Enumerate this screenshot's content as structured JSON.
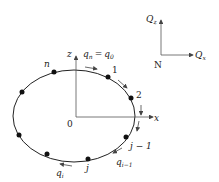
{
  "diagram": {
    "type": "elliptical closed contour with discrete nodes",
    "axes": {
      "origin_label": "0",
      "x_label": "x",
      "z_label": "z"
    },
    "force_axes": {
      "origin_label": "N",
      "horizontal_label": "Q",
      "horizontal_sub": "x",
      "vertical_label": "Q",
      "vertical_sub": "z"
    },
    "node_labels": {
      "n": "n",
      "one": "1",
      "two": "2",
      "j_minus_1": "j − 1",
      "j": "j"
    },
    "flow_labels": {
      "top_q": "q",
      "top_q_sub": "n",
      "top_eq": "=",
      "top_q0": "q",
      "top_q0_sub": "0",
      "qi": "q",
      "qi_sub": "i",
      "qi_minus_1": "q",
      "qi_minus_1_sub": "i−1"
    },
    "node_count_visible": 8,
    "colors": {
      "stroke": "#222222",
      "axis": "#555555",
      "node": "#111111"
    }
  }
}
